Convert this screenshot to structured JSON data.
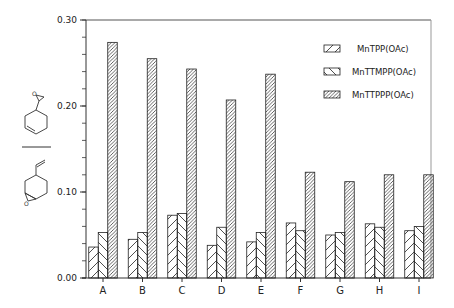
{
  "chart_data": {
    "type": "bar",
    "title": "",
    "xlabel": "",
    "ylabel": "ratio: 4-vinylcyclohexene side-chain epoxide / ring epoxide (structural formulas)",
    "ylim": [
      0.0,
      0.3
    ],
    "yticks": [
      "0.00",
      "0.10",
      "0.20",
      "0.30"
    ],
    "ytick_values": [
      0.0,
      0.1,
      0.2,
      0.3
    ],
    "minor_ytick_step": 0.02,
    "grid": false,
    "legend_position": "upper right",
    "categories": [
      "A",
      "B",
      "C",
      "D",
      "E",
      "F",
      "G",
      "H",
      "I"
    ],
    "series": [
      {
        "name": "MnTPP(OAc)",
        "pattern": "sparse-diagonal",
        "values": [
          0.036,
          0.045,
          0.073,
          0.038,
          0.042,
          0.064,
          0.05,
          0.063,
          0.055
        ]
      },
      {
        "name": "MnTTMPP(OAc)",
        "pattern": "back-diagonal",
        "values": [
          0.053,
          0.053,
          0.075,
          0.059,
          0.053,
          0.055,
          0.053,
          0.059,
          0.06
        ]
      },
      {
        "name": "MnTTPPP(OAc)",
        "pattern": "dense-diagonal",
        "values": [
          0.274,
          0.255,
          0.243,
          0.207,
          0.237,
          0.123,
          0.112,
          0.12,
          0.12
        ]
      }
    ]
  },
  "legend": {
    "items": [
      {
        "label": "MnTPP(OAc)"
      },
      {
        "label": "MnTTMPP(OAc)"
      },
      {
        "label": "MnTTPPP(OAc)"
      }
    ]
  },
  "ylabel_structures": {
    "numerator": {
      "description": "4-vinylcyclohexene 1,2-epoxide (side-chain epoxide)",
      "atom_label": "O"
    },
    "denominator": {
      "description": "4-vinylcyclohexene ring epoxide",
      "atom_label": "O"
    }
  },
  "colors": {
    "ink": "#222222",
    "frame": "#888888",
    "background": "#ffffff"
  }
}
